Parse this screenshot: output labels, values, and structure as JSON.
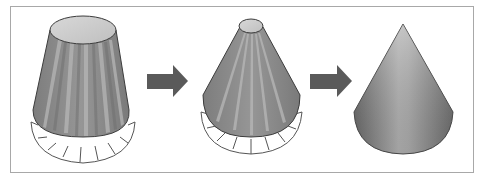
{
  "diagram": {
    "type": "process-sequence",
    "steps": [
      {
        "id": "step-1",
        "shape": "pleated-truncated-cone",
        "has_base_ring": true,
        "top": "large-ellipse"
      },
      {
        "id": "step-2",
        "shape": "pleated-cone",
        "has_base_ring": true,
        "top": "small-ellipse"
      },
      {
        "id": "step-3",
        "shape": "smooth-cone",
        "has_base_ring": false,
        "top": "apex"
      }
    ],
    "connectors": [
      {
        "from": "step-1",
        "to": "step-2",
        "icon": "arrow-right-icon"
      },
      {
        "from": "step-2",
        "to": "step-3",
        "icon": "arrow-right-icon"
      }
    ]
  },
  "colors": {
    "frame": "#a8a8a8",
    "cone_body": "#8c8c8c",
    "cone_body_dark": "#6e6e6e",
    "pleat_light": "#b4b4b4",
    "cone_top": "#cfcfcf",
    "outline": "#3c3c3c",
    "arrow": "#5a5a5a",
    "ring": "#555555"
  }
}
